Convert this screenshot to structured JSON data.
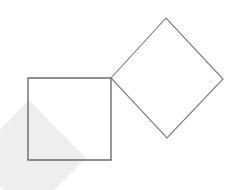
{
  "figure": {
    "canvas": {
      "width": 239,
      "height": 190,
      "background": "#ffffff"
    },
    "shapes": [
      {
        "name": "watermark-diamond",
        "role": "background-watermark",
        "kind": "polygon",
        "points": "29,100 86,158 29,215 -28,158",
        "fill": "#eeeeee",
        "stroke": "none",
        "stroke_width": 0
      },
      {
        "name": "left-square",
        "role": "axis-aligned-square",
        "kind": "polygon",
        "points": "28,78 111,78 111,160 28,160",
        "fill": "none",
        "stroke": "#6b6b6b",
        "stroke_width": 1.4
      },
      {
        "name": "right-diamond",
        "role": "rotated-square",
        "kind": "polygon",
        "points": "111,78 166,18 223,79 167,138",
        "fill": "none",
        "stroke": "#7a7a7a",
        "stroke_width": 1.1
      }
    ],
    "vertices": [
      {
        "name": "square-top-left",
        "x": 28,
        "y": 78
      },
      {
        "name": "square-top-right-shared",
        "x": 111,
        "y": 78
      },
      {
        "name": "square-bottom-right",
        "x": 111,
        "y": 160
      },
      {
        "name": "square-bottom-left",
        "x": 28,
        "y": 160
      },
      {
        "name": "diamond-left-shared",
        "x": 111,
        "y": 78
      },
      {
        "name": "diamond-top",
        "x": 166,
        "y": 18
      },
      {
        "name": "diamond-right",
        "x": 223,
        "y": 79
      },
      {
        "name": "diamond-bottom",
        "x": 167,
        "y": 138
      }
    ]
  },
  "colors": {
    "background": "#ffffff",
    "square_stroke": "#6b6b6b",
    "diamond_stroke": "#7a7a7a",
    "watermark_fill": "#eeeeee"
  }
}
